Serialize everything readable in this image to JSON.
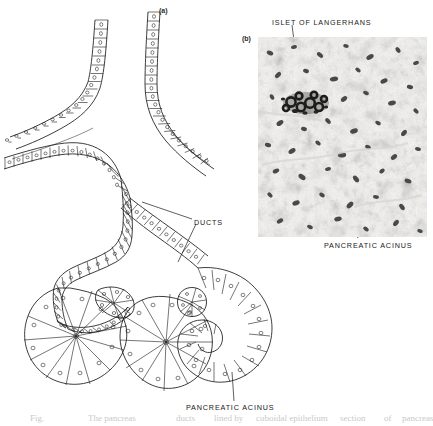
{
  "figure": {
    "title_caption_fragment": "Fig. The pancreas: (a) ducts lined by cuboidal epithelium; (b) section of pancreas",
    "background_color": "#ffffff",
    "ink_color": "#1a1a1a"
  },
  "panels": [
    {
      "tag": "(a)",
      "name": "line-drawing-panel",
      "description": "Schematic line drawing of pancreatic ducts and acini"
    },
    {
      "tag": "(b)",
      "name": "photomicrograph-panel",
      "description": "Histological photomicrograph of pancreas tissue"
    }
  ],
  "labels": [
    {
      "id": "ducts",
      "text": "DUCTS",
      "x": 194,
      "y": 219,
      "panel": "a"
    },
    {
      "id": "pancreatic-acinus-drawing",
      "text": "PANCREATIC ACINUS",
      "x": 186,
      "y": 404,
      "panel": "a"
    },
    {
      "id": "islet-of-langerhans",
      "text": "ISLET OF LANGERHANS",
      "x": 272,
      "y": 19,
      "panel": "b"
    },
    {
      "id": "pancreatic-acinus-photo",
      "text": "PANCREATIC ACINUS",
      "x": 324,
      "y": 242,
      "panel": "b"
    }
  ],
  "panel_tags": {
    "a": {
      "text": "(a)",
      "x": 159,
      "y": 7
    },
    "b": {
      "text": "(b)",
      "x": 242,
      "y": 35
    }
  },
  "photo": {
    "x": 258,
    "y": 37,
    "width": 169,
    "height": 200,
    "base_color": "#f2f1ef",
    "stain_color": "#6e6d6b",
    "islet_color": "#1c1c1c",
    "islet_center_x": 48,
    "islet_center_y": 66
  },
  "caption_fragments": [
    {
      "text": "Fig.",
      "x": 30,
      "y": 1
    },
    {
      "text": "The pancreas",
      "x": 88,
      "y": 1
    },
    {
      "text": "ducts",
      "x": 176,
      "y": 1
    },
    {
      "text": "lined by",
      "x": 214,
      "y": 1
    },
    {
      "text": "cuboidal epithelium",
      "x": 256,
      "y": 1
    },
    {
      "text": "section",
      "x": 340,
      "y": 1
    },
    {
      "text": "of",
      "x": 384,
      "y": 1
    },
    {
      "text": "pancreas",
      "x": 402,
      "y": 1
    }
  ]
}
